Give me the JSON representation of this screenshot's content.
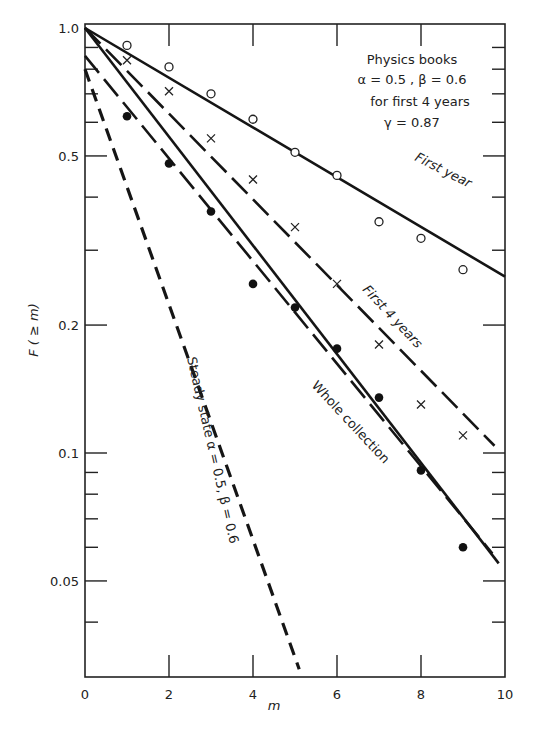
{
  "chart_data": {
    "type": "line",
    "title": "",
    "xlabel": "m",
    "ylabel": "F ( ≥ m)",
    "xlim": [
      0,
      10
    ],
    "ylim": [
      0.03,
      1.0
    ],
    "yscale": "log",
    "x_ticks": [
      0,
      2,
      4,
      6,
      8,
      10
    ],
    "y_tick_labels": [
      "1.0",
      "0.5",
      "0.2",
      "0.1",
      "0.05"
    ],
    "y_tick_values": [
      1.0,
      0.5,
      0.2,
      0.1,
      0.05
    ],
    "y_minor_ticks": [
      0.9,
      0.8,
      0.7,
      0.6,
      0.4,
      0.3,
      0.09,
      0.08,
      0.07,
      0.06,
      0.04
    ],
    "x_minor_ticks": [
      1,
      3,
      5,
      7,
      9
    ],
    "grid": false,
    "annotation_box": {
      "line1": "Physics books",
      "line2": "α = 0.5 , β = 0.6",
      "line3": "for first 4 years",
      "line4": "γ = 0.87"
    },
    "series": [
      {
        "name": "First year",
        "marker": "open-circle",
        "points_x": [
          1,
          2,
          3,
          4,
          5,
          6,
          7,
          8,
          9
        ],
        "points_y": [
          0.91,
          0.81,
          0.7,
          0.61,
          0.51,
          0.45,
          0.35,
          0.32,
          0.27
        ],
        "fit_line": {
          "style": "solid",
          "x": [
            0,
            10
          ],
          "y": [
            1.0,
            0.26
          ]
        }
      },
      {
        "name": "First 4 years",
        "marker": "cross",
        "points_x": [
          1,
          2,
          3,
          4,
          5,
          6,
          7,
          8,
          9
        ],
        "points_y": [
          0.84,
          0.71,
          0.55,
          0.44,
          0.34,
          0.25,
          0.18,
          0.13,
          0.11
        ],
        "fit_line": {
          "style": "long-dash",
          "x": [
            0,
            9.75
          ],
          "y": [
            1.0,
            0.104
          ]
        }
      },
      {
        "name": "Whole collection",
        "marker": "filled-circle",
        "points_x": [
          1,
          2,
          3,
          4,
          5,
          6,
          7,
          8,
          9
        ],
        "points_y": [
          0.62,
          0.48,
          0.37,
          0.25,
          0.22,
          0.176,
          0.135,
          0.091,
          0.06
        ],
        "fit_line": {
          "style": "solid",
          "x": [
            0,
            9.85
          ],
          "y": [
            1.0,
            0.055
          ]
        },
        "fit_line_2": {
          "style": "long-dash",
          "x": [
            0,
            9.7
          ],
          "y": [
            0.86,
            0.058
          ]
        }
      },
      {
        "name": "Steady state α = 0.5, β = 0.6",
        "marker": "none",
        "fit_line": {
          "style": "short-dash",
          "x": [
            0,
            5.1
          ],
          "y": [
            0.8,
            0.031
          ]
        }
      }
    ],
    "curve_labels": {
      "first_year": "First year",
      "first_4_years": "First 4 years",
      "whole_collection": "Whole collection",
      "steady_state": "Steady state α = 0.5, β = 0.6"
    }
  }
}
